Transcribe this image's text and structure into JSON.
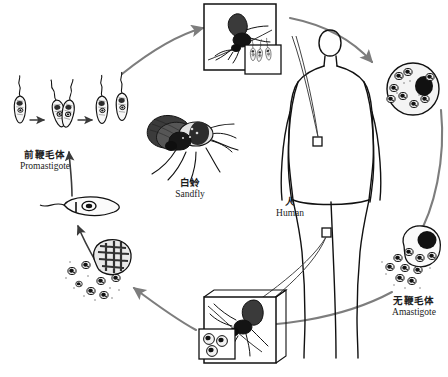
{
  "diagram": {
    "background_color": "#ffffff",
    "ink_color": "#111111",
    "arrow_color": "#7d7d7d",
    "labels": {
      "promastigote": {
        "cn": "前鞭毛体",
        "en": "Promastigote"
      },
      "sandfly": {
        "cn": "白蛉",
        "en": "Sandfly"
      },
      "human": {
        "cn": "人",
        "en": "Human"
      },
      "amastigote": {
        "cn": "无鞭毛体",
        "en": "Amastigote"
      }
    },
    "stages": [
      {
        "name": "promastigote-row",
        "description": "four flagellated promastigotes dividing by binary fission",
        "count": 4
      },
      {
        "name": "single-promastigote",
        "description": "single elongated promastigote with flagellum",
        "count": 1
      },
      {
        "name": "macrophage-left-burst",
        "description": "ruptured macrophage releasing amastigotes",
        "count": 1
      },
      {
        "name": "macrophage-right-burst",
        "description": "ruptured macrophage releasing amastigotes",
        "count": 1
      },
      {
        "name": "infected-macrophage",
        "description": "round macrophage filled with amastigotes",
        "count": 1
      }
    ],
    "insets": [
      {
        "name": "sandfly-bite-top",
        "description": "sandfly feeding on skin, injects promastigotes",
        "sub_inset": "promastigotes"
      },
      {
        "name": "sandfly-bite-bottom",
        "description": "sandfly feeding on skin, ingests amastigotes",
        "sub_inset": "amastigotes"
      }
    ],
    "central_illustration": {
      "name": "sandfly-detail",
      "description": "detailed drawing of an adult sandfly"
    },
    "body_figure": {
      "name": "human-figure",
      "description": "outline of a standing human with two bite-site markers"
    }
  }
}
